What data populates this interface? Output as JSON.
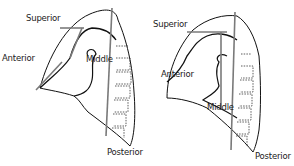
{
  "diagram": {
    "type": "anatomical-diagram",
    "panels": [
      {
        "id": "left",
        "labels": {
          "superior": "Superior",
          "anterior": "Anterior",
          "middle": "Middle",
          "posterior": "Posterior"
        }
      },
      {
        "id": "right",
        "labels": {
          "superior": "Superior",
          "anterior": "Anterior",
          "middle": "Middle",
          "posterior": "Posterior"
        }
      }
    ],
    "colors": {
      "outline": "#111111",
      "division_line": "#7a7a7a",
      "vertebra_dotted": "#333333",
      "background": "#ffffff"
    }
  }
}
